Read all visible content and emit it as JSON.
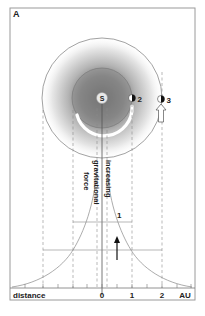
{
  "panel_label": "A",
  "sun_label": "S",
  "planets": [
    {
      "id": "planet-2",
      "label": "2"
    },
    {
      "id": "planet-3",
      "label": "3"
    }
  ],
  "curve_label": "1",
  "force_text": {
    "line1": "increasing",
    "line2": "gravitational",
    "line3": "force"
  },
  "axis": {
    "title": "distance",
    "unit": "AU",
    "ticks": [
      "0",
      "1",
      "2"
    ]
  },
  "colors": {
    "frame": "#9a9a9a",
    "field_dark": "#6e6e6e",
    "lines": "#777777",
    "text": "#222222"
  }
}
